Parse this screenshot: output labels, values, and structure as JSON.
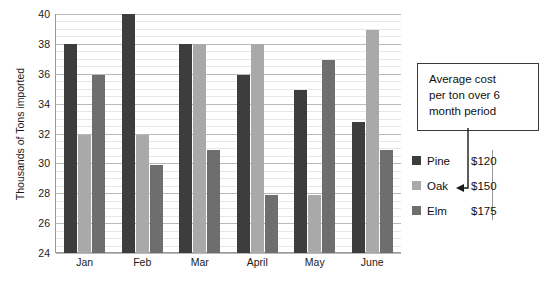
{
  "chart_data": {
    "type": "bar",
    "title": "",
    "xlabel": "",
    "ylabel": "Thousands of Tons imported",
    "ylim": [
      24,
      40
    ],
    "ytick_step": 2,
    "yticks": [
      40,
      38,
      36,
      34,
      32,
      30,
      28,
      26,
      24
    ],
    "grid": true,
    "legend_position": "right",
    "categories": [
      "Jan",
      "Feb",
      "Mar",
      "April",
      "May",
      "June"
    ],
    "series": [
      {
        "name": "Pine",
        "color": "#3d3d3d",
        "cost_per_ton": "$120",
        "values": [
          38,
          40,
          38,
          35.9,
          34.9,
          32.8
        ]
      },
      {
        "name": "Oak",
        "color": "#a9a9a9",
        "cost_per_ton": "$150",
        "values": [
          31.9,
          31.9,
          38,
          38,
          27.9,
          38.9
        ]
      },
      {
        "name": "Elm",
        "color": "#6e6e6e",
        "cost_per_ton": "$175",
        "values": [
          35.9,
          29.9,
          30.9,
          27.9,
          36.9,
          30.9
        ]
      }
    ],
    "annotations": [
      {
        "name": "average-cost-callout",
        "lines": [
          "Average cost",
          "per ton over 6",
          "month period"
        ],
        "points_to": "Oak"
      }
    ]
  },
  "legend": {
    "rows": [
      {
        "name": "Pine",
        "value": "$120"
      },
      {
        "name": "Oak",
        "value": "$150"
      },
      {
        "name": "Elm",
        "value": "$175"
      }
    ]
  },
  "callout": {
    "line1": "Average cost",
    "line2": "per ton over 6",
    "line3": "month period"
  }
}
